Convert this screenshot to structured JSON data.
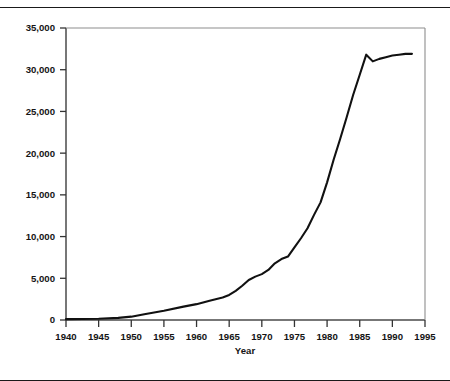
{
  "figure": {
    "top_rule_color": "#1a1a1a",
    "line_color": "#111111",
    "frame_color": "#4a4a4a",
    "clipped_caption": ""
  },
  "chart_data": {
    "type": "line",
    "title": "",
    "xlabel": "Year",
    "ylabel": "",
    "xlim": [
      1940,
      1995
    ],
    "ylim": [
      0,
      35000
    ],
    "grid": false,
    "legend": "none",
    "xticks": [
      1940,
      1945,
      1950,
      1955,
      1960,
      1965,
      1970,
      1975,
      1980,
      1985,
      1990,
      1995
    ],
    "xtick_labels": [
      "1940",
      "1945",
      "1950",
      "1955",
      "1960",
      "1965",
      "1970",
      "1975",
      "1980",
      "1985",
      "1990",
      "1995"
    ],
    "yticks": [
      0,
      5000,
      10000,
      15000,
      20000,
      25000,
      30000,
      35000
    ],
    "ytick_labels": [
      "0",
      "5,000",
      "10,000",
      "15,000",
      "20,000",
      "25,000",
      "30,000",
      "35,000"
    ],
    "series": [
      {
        "name": "value",
        "x": [
          1940,
          1945,
          1948,
          1950,
          1952,
          1955,
          1958,
          1960,
          1962,
          1964,
          1965,
          1966,
          1967,
          1968,
          1969,
          1970,
          1971,
          1972,
          1973,
          1974,
          1975,
          1976,
          1977,
          1978,
          1979,
          1980,
          1981,
          1982,
          1983,
          1984,
          1985,
          1986,
          1987,
          1988,
          1989,
          1990,
          1991,
          1992,
          1993
        ],
        "values": [
          100,
          150,
          250,
          400,
          700,
          1100,
          1600,
          1900,
          2300,
          2700,
          3000,
          3500,
          4100,
          4800,
          5200,
          5500,
          6000,
          6800,
          7300,
          7600,
          8700,
          9800,
          11000,
          12600,
          14100,
          16500,
          19200,
          21700,
          24300,
          27000,
          29400,
          31800,
          31000,
          31300,
          31500,
          31700,
          31800,
          31900,
          31900
        ]
      }
    ]
  }
}
